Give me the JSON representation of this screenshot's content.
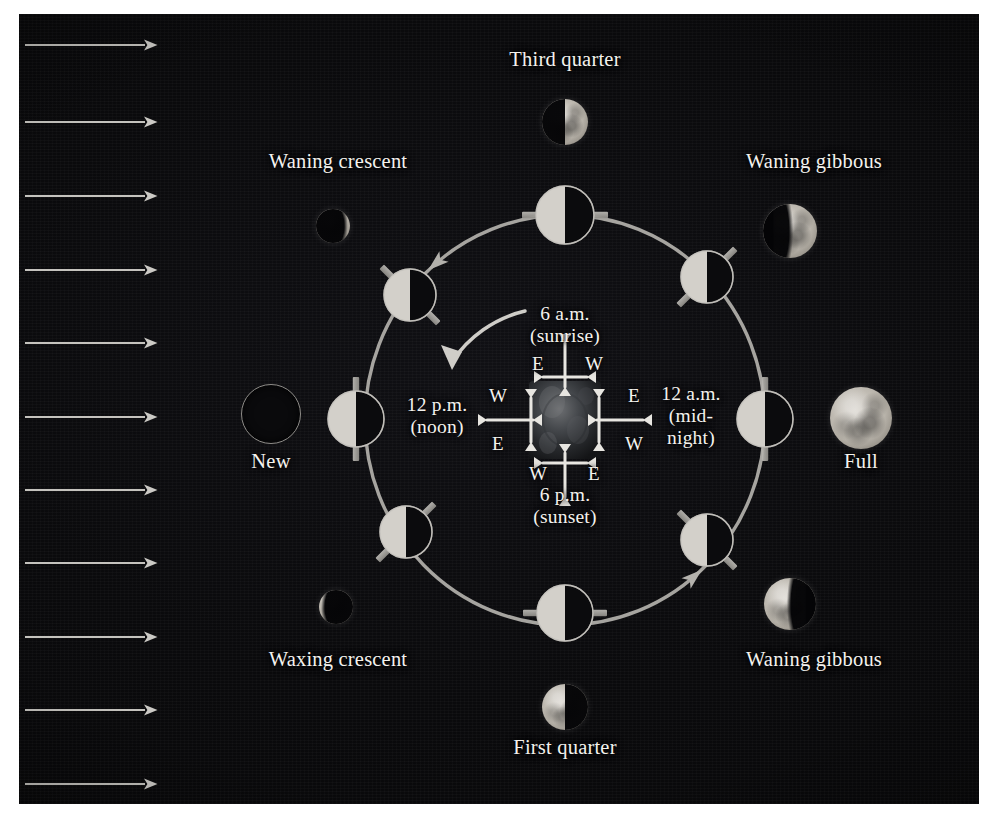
{
  "figure": {
    "background_color": "#050506",
    "accent_color": "#9a9a96",
    "label_color": "#f4f2ee"
  },
  "sunlight": {
    "name": "sunlight-rays",
    "direction": "left-to-right",
    "arrow_count": 11,
    "color": "#cfcdc8",
    "arrows": [
      {
        "y": 45
      },
      {
        "y": 122
      },
      {
        "y": 196
      },
      {
        "y": 270
      },
      {
        "y": 343
      },
      {
        "y": 417
      },
      {
        "y": 490
      },
      {
        "y": 563
      },
      {
        "y": 637
      },
      {
        "y": 710
      },
      {
        "y": 784
      }
    ],
    "x_start": 25,
    "x_end": 156
  },
  "orbit": {
    "name": "moon-orbit-path",
    "center_x": 565,
    "center_y": 420,
    "radius_x": 200,
    "radius_y": 205,
    "color": "#b3b1ac",
    "direction": "counterclockwise",
    "arrowhead_angles_deg": [
      40,
      130,
      220,
      310
    ]
  },
  "earth": {
    "name": "earth",
    "center_x": 565,
    "center_y": 420,
    "width": 72,
    "height": 78,
    "rotation_label": "counterclockwise rotation"
  },
  "rotation_arrow": {
    "name": "earth-rotation-arrow",
    "description": "curved arrow indicating Earth's counterclockwise rotation"
  },
  "time_labels": [
    {
      "id": "sunrise",
      "name": "time-label-sunrise",
      "line1": "6 a.m.",
      "line2": "(sunrise)",
      "x": 565,
      "y": 325
    },
    {
      "id": "noon",
      "name": "time-label-noon",
      "line1": "12 p.m.",
      "line2": "(noon)",
      "x": 437,
      "y": 416
    },
    {
      "id": "midnight",
      "name": "time-label-midnight",
      "line1": "12 a.m.",
      "line2": "(mid-",
      "line3": "night)",
      "x": 691,
      "y": 416
    },
    {
      "id": "sunset",
      "name": "time-label-sunset",
      "line1": "6 p.m.",
      "line2": "(sunset)",
      "x": 565,
      "y": 506
    }
  ],
  "compass_marks": [
    {
      "id": "top-e",
      "name": "compass-top-east",
      "text": "E",
      "x": 538,
      "y": 364
    },
    {
      "id": "top-w",
      "name": "compass-top-west",
      "text": "W",
      "x": 594,
      "y": 364
    },
    {
      "id": "left-w",
      "name": "compass-left-west",
      "text": "W",
      "x": 498,
      "y": 396
    },
    {
      "id": "left-e",
      "name": "compass-left-east",
      "text": "E",
      "x": 498,
      "y": 444
    },
    {
      "id": "right-e",
      "name": "compass-right-east",
      "text": "E",
      "x": 634,
      "y": 396
    },
    {
      "id": "right-w",
      "name": "compass-right-west",
      "text": "W",
      "x": 634,
      "y": 444
    },
    {
      "id": "bot-w",
      "name": "compass-bottom-west",
      "text": "W",
      "x": 538,
      "y": 474
    },
    {
      "id": "bot-e",
      "name": "compass-bottom-east",
      "text": "E",
      "x": 594,
      "y": 474
    }
  ],
  "outer_phases": [
    {
      "id": "third-quarter",
      "name": "phase-third-quarter",
      "label": "Third quarter",
      "label_x": 565,
      "label_y": 60,
      "moon_x": 565,
      "moon_y": 122,
      "moon_size": 46,
      "lit": "right-half",
      "type": "photo"
    },
    {
      "id": "waning-gibbous-top",
      "name": "phase-waning-gibbous-upper",
      "label": "Waning gibbous",
      "label_x": 814,
      "label_y": 162,
      "moon_x": 790,
      "moon_y": 231,
      "moon_size": 54,
      "lit": "gibbous-right",
      "type": "photo"
    },
    {
      "id": "full",
      "name": "phase-full",
      "label": "Full",
      "label_x": 861,
      "label_y": 462,
      "moon_x": 861,
      "moon_y": 418,
      "moon_size": 62,
      "lit": "full",
      "type": "photo"
    },
    {
      "id": "waning-gibbous-bottom",
      "name": "phase-waning-gibbous-lower",
      "label": "Waning gibbous",
      "label_x": 814,
      "label_y": 660,
      "moon_x": 790,
      "moon_y": 604,
      "moon_size": 52,
      "lit": "gibbous-left",
      "type": "photo"
    },
    {
      "id": "first-quarter",
      "name": "phase-first-quarter",
      "label": "First quarter",
      "label_x": 565,
      "label_y": 748,
      "moon_x": 565,
      "moon_y": 707,
      "moon_size": 46,
      "lit": "left-half",
      "type": "photo"
    },
    {
      "id": "waxing-crescent",
      "name": "phase-waxing-crescent",
      "label": "Waxing crescent",
      "label_x": 338,
      "label_y": 660,
      "moon_x": 336,
      "moon_y": 607,
      "moon_size": 34,
      "lit": "crescent-left",
      "type": "photo"
    },
    {
      "id": "new",
      "name": "phase-new",
      "label": "New",
      "label_x": 271,
      "label_y": 462,
      "moon_x": 271,
      "moon_y": 414,
      "moon_size": 58,
      "lit": "none",
      "type": "outline"
    },
    {
      "id": "waning-crescent",
      "name": "phase-waning-crescent",
      "label": "Waning crescent",
      "label_x": 338,
      "label_y": 162,
      "moon_x": 333,
      "moon_y": 226,
      "moon_size": 34,
      "lit": "crescent-right",
      "type": "photo"
    }
  ],
  "orbit_moons": [
    {
      "id": "om-top",
      "name": "orbit-moon-top",
      "angle_deg": 90,
      "x": 565,
      "y": 215,
      "r": 29,
      "bar_angle_deg": 0
    },
    {
      "id": "om-tr",
      "name": "orbit-moon-top-right",
      "angle_deg": 45,
      "x": 707,
      "y": 277,
      "r": 26,
      "bar_angle_deg": -45
    },
    {
      "id": "om-right",
      "name": "orbit-moon-right",
      "angle_deg": 0,
      "x": 765,
      "y": 419,
      "r": 28,
      "bar_angle_deg": -90
    },
    {
      "id": "om-br",
      "name": "orbit-moon-bottom-right",
      "angle_deg": -45,
      "x": 707,
      "y": 540,
      "r": 26,
      "bar_angle_deg": 45
    },
    {
      "id": "om-bot",
      "name": "orbit-moon-bottom",
      "angle_deg": -90,
      "x": 565,
      "y": 613,
      "r": 28,
      "bar_angle_deg": 0
    },
    {
      "id": "om-bl",
      "name": "orbit-moon-bottom-left",
      "angle_deg": 225,
      "x": 406,
      "y": 532,
      "r": 26,
      "bar_angle_deg": -45
    },
    {
      "id": "om-left",
      "name": "orbit-moon-left",
      "angle_deg": 180,
      "x": 356,
      "y": 419,
      "r": 28,
      "bar_angle_deg": -90
    },
    {
      "id": "om-tl",
      "name": "orbit-moon-top-left",
      "angle_deg": 135,
      "x": 410,
      "y": 295,
      "r": 26,
      "bar_angle_deg": 45
    }
  ]
}
